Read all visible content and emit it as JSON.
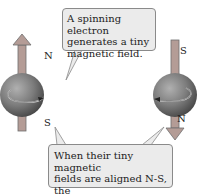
{
  "diagram": {
    "callout_top": {
      "lines": [
        "A spinning electron",
        "generates a tiny",
        "magnetic field."
      ]
    },
    "callout_bottom": {
      "lines": [
        "When their tiny magnetic",
        "fields are aligned N-S, the",
        "electron spins are paired."
      ]
    },
    "left_electron": {
      "top_pole": "N",
      "bottom_pole": "S",
      "arrow_direction": "up"
    },
    "right_electron": {
      "top_pole": "S",
      "bottom_pole": "N",
      "arrow_direction": "down"
    },
    "colors": {
      "arrow": "#b49c96",
      "arrow_stroke": "#6e6e6e",
      "sphere_light": "#a5a5a5",
      "sphere_dark": "#4a4a4a",
      "callout_fill": "#ebebeb",
      "callout_border": "#8a8a8a"
    }
  }
}
